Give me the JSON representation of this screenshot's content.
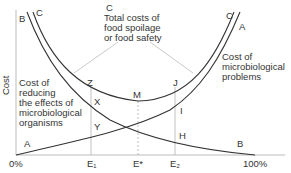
{
  "diagram": {
    "y_axis_label": "Cost",
    "x_axis_ticks": [
      "0%",
      "E₁",
      "E*",
      "E₂",
      "100%"
    ],
    "curves": {
      "B": {
        "end_label_top": "B",
        "end_label_bottom": "B",
        "description": "Cost of reducing the effects of microbiological organisms"
      },
      "A": {
        "start_label": "A",
        "end_label": "A",
        "description": "Cost of microbiological problems"
      },
      "C": {
        "left_label": "C",
        "right_label": "C",
        "description": "Total costs of food spoilage or food safety"
      }
    },
    "annotations": {
      "total_c_label": "C",
      "total_line1": "Total costs of",
      "total_line2": "food spoilage",
      "total_line3": "or food safety",
      "micro_line1": "Cost of",
      "micro_line2": "microbiological",
      "micro_line3": "problems",
      "reduce_line1": "Cost of",
      "reduce_line2": "reducing",
      "reduce_line3": "the effects of",
      "reduce_line4": "microbiological",
      "reduce_line5": "organisms"
    },
    "points": {
      "Z": "Z",
      "X": "X",
      "Y": "Y",
      "M": "M",
      "J": "J",
      "I": "I",
      "H": "H"
    }
  }
}
